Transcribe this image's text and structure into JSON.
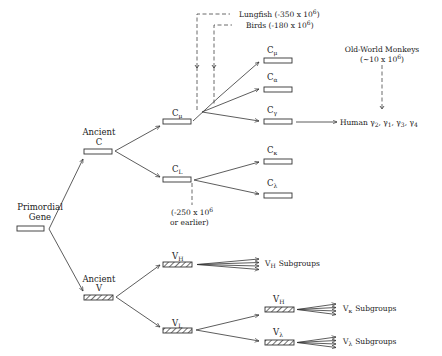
{
  "diagram": {
    "root": {
      "label_line1": "Primordial",
      "label_line2": "Gene"
    },
    "ancient_c": {
      "label_line1": "Ancient",
      "label_line2": "C"
    },
    "ancient_v": {
      "label_line1": "Ancient",
      "label_line2": "V"
    },
    "c_mu_parent": {
      "base": "C",
      "sub": "μ"
    },
    "c_l": {
      "base": "C",
      "sub": "L"
    },
    "c_mu": {
      "base": "C",
      "sub": "μ"
    },
    "c_alpha": {
      "base": "C",
      "sub": "α"
    },
    "c_gamma": {
      "base": "C",
      "sub": "γ"
    },
    "c_kappa": {
      "base": "C",
      "sub": "κ"
    },
    "c_lambda": {
      "base": "C",
      "sub": "λ"
    },
    "v_h": {
      "base": "V",
      "sub": "H"
    },
    "v_l": {
      "base": "V",
      "sub": "L"
    },
    "v_kappa_node": {
      "base": "V",
      "sub": "H"
    },
    "v_lambda_node": {
      "base": "V",
      "sub": "λ"
    },
    "annotations": {
      "lungfish": "Lungfish (-350 x 10",
      "lungfish_exp": "6",
      "lungfish_close": ")",
      "birds": "Birds (-180 x 10",
      "birds_exp": "6",
      "birds_close": ")",
      "cl_time_line1": "(-250 x 10",
      "cl_time_exp": "6",
      "cl_time_line2": "or earlier)",
      "owm_line1": "Old-World Monkeys",
      "owm_line2": "(∼10 x 10",
      "owm_exp": "6",
      "owm_close": ")"
    },
    "human": {
      "prefix": "Human γ",
      "s1": "2",
      "g2": ", γ",
      "s2": "1",
      "g3": ", γ",
      "s3": "3",
      "g4": ", γ",
      "s4": "4"
    },
    "subgroups": {
      "vh": {
        "base": "V",
        "sub": "H",
        "text": "Subgroups"
      },
      "vk": {
        "base": "V",
        "sub": "κ",
        "text": "Subgroups"
      },
      "vl": {
        "base": "V",
        "sub": "λ",
        "text": "Subgroups"
      }
    },
    "colors": {
      "ink": "#333333",
      "background": "#ffffff"
    }
  }
}
